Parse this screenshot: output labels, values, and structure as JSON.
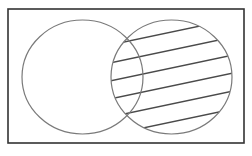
{
  "diagram": {
    "type": "venn",
    "universe": {
      "label": "",
      "shown": true
    },
    "sets": [
      {
        "id": "A",
        "label": "",
        "position": "left"
      },
      {
        "id": "B",
        "label": "",
        "position": "right"
      }
    ],
    "shaded_region": {
      "description": "Set B (entire right circle, including the intersection with A)",
      "sets": [
        "B"
      ],
      "fill_style": "diagonal-hatch",
      "hatch_line_count": 6
    },
    "colors": {
      "universe_border": "#333333",
      "set_outline": "#7a7a7a",
      "hatch": "#4a4a4a",
      "background": "#ffffff"
    }
  }
}
